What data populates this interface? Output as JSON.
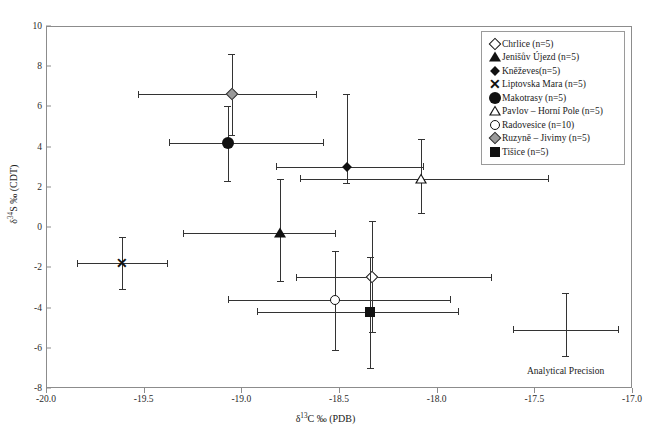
{
  "chart_data": {
    "type": "scatter",
    "title": "",
    "xlabel": "δ¹³C ‰ (PDB)",
    "ylabel": "δ³⁴S ‰ (CDT)",
    "xlim": [
      -20.0,
      -17.0
    ],
    "ylim": [
      -8,
      10
    ],
    "xticks": [
      "-20.0",
      "-19.5",
      "-19.0",
      "-18.5",
      "-18.0",
      "-17.5",
      "-17.0"
    ],
    "xtick_values": [
      -20.0,
      -19.5,
      -19.0,
      -18.5,
      -18.0,
      -17.5,
      -17.0
    ],
    "yticks": [
      "10",
      "8",
      "6",
      "4",
      "2",
      "0",
      "-2",
      "-4",
      "-6",
      "-8"
    ],
    "ytick_values": [
      10,
      8,
      6,
      4,
      2,
      0,
      -2,
      -4,
      -6,
      -8
    ],
    "grid": false,
    "legend_position": "top-right",
    "series": [
      {
        "name": "Chrlice (n=5)",
        "marker": "diamond-open",
        "x": -18.33,
        "y": -2.5,
        "xerr_low": -18.72,
        "xerr_high": -17.72,
        "yerr_low": -5.2,
        "yerr_high": 0.3
      },
      {
        "name": "Jenišův Újezd (n=5)",
        "marker": "triangle-filled",
        "x": -18.8,
        "y": -0.3,
        "xerr_low": -19.3,
        "xerr_high": -18.52,
        "yerr_low": -2.7,
        "yerr_high": 2.4
      },
      {
        "name": "Kněževes(n=5)",
        "marker": "diamond-filled",
        "x": -18.46,
        "y": 3.0,
        "xerr_low": -18.82,
        "xerr_high": -18.07,
        "yerr_low": 2.2,
        "yerr_high": 6.6
      },
      {
        "name": "Liptovska Mara (n=5)",
        "marker": "x-cross",
        "x": -19.61,
        "y": -1.8,
        "xerr_low": -19.84,
        "xerr_high": -19.38,
        "yerr_low": -3.1,
        "yerr_high": -0.5
      },
      {
        "name": "Makotrasy (n=5)",
        "marker": "circle-filled",
        "x": -19.07,
        "y": 4.2,
        "xerr_low": -19.37,
        "xerr_high": -18.58,
        "yerr_low": 2.3,
        "yerr_high": 6.0
      },
      {
        "name": "Pavlov – Horní Pole (n=5)",
        "marker": "triangle-open",
        "x": -18.08,
        "y": 2.4,
        "xerr_low": -18.7,
        "xerr_high": -17.43,
        "yerr_low": 0.7,
        "yerr_high": 4.4
      },
      {
        "name": "Radovesice (n=10)",
        "marker": "circle-open",
        "x": -18.52,
        "y": -3.6,
        "xerr_low": -19.07,
        "xerr_high": -17.93,
        "yerr_low": -6.1,
        "yerr_high": -1.2
      },
      {
        "name": "Ruzyně – Jivimy (n=5)",
        "marker": "diamond-gray",
        "x": -19.05,
        "y": 6.6,
        "xerr_low": -19.53,
        "xerr_high": -18.62,
        "yerr_low": 4.6,
        "yerr_high": 8.6
      },
      {
        "name": "Tišice (n=5)",
        "marker": "square-filled",
        "x": -18.34,
        "y": -4.2,
        "xerr_low": -18.92,
        "xerr_high": -17.89,
        "yerr_low": -7.0,
        "yerr_high": -1.5
      }
    ],
    "annotations": [
      {
        "name": "analytical-precision",
        "label": "Analytical Precision",
        "x": -17.34,
        "y": -5.1,
        "xerr_low": -17.61,
        "xerr_high": -17.07,
        "yerr_low": -6.4,
        "yerr_high": -3.3,
        "label_y": -6.9
      }
    ]
  },
  "legend": {
    "items": [
      {
        "label": "Chrlice (n=5)",
        "marker": "diamond-open"
      },
      {
        "label": "Jenišův Újezd (n=5)",
        "marker": "triangle-filled"
      },
      {
        "label": "Kněževes(n=5)",
        "marker": "diamond-filled"
      },
      {
        "label": "Liptovska Mara (n=5)",
        "marker": "x-cross"
      },
      {
        "label": "Makotrasy (n=5)",
        "marker": "circle-filled"
      },
      {
        "label": "Pavlov – Horní Pole (n=5)",
        "marker": "triangle-open"
      },
      {
        "label": "Radovesice (n=10)",
        "marker": "circle-open"
      },
      {
        "label": "Ruzyně – Jivimy (n=5)",
        "marker": "diamond-gray"
      },
      {
        "label": "Tišice (n=5)",
        "marker": "square-filled"
      }
    ]
  },
  "colors": {
    "axis": "#8c8c8c",
    "marker": "#111111",
    "errorbar": "#333333",
    "gray_fill": "#9a9a9a",
    "background": "#ffffff"
  }
}
